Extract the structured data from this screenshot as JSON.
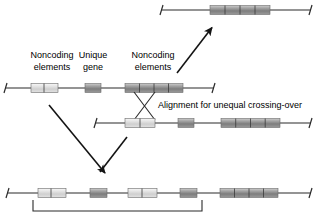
{
  "figure": {
    "background_color": "#ffffff",
    "width": 318,
    "height": 217
  },
  "labels": {
    "noncoding_left_line1": "Noncoding",
    "noncoding_left_line2": "elements",
    "unique_gene_line1": "Unique",
    "unique_gene_line2": "gene",
    "noncoding_right_line1": "Noncoding",
    "noncoding_right_line2": "elements",
    "alignment_text": "Alignment for unequal crossing-over"
  },
  "colors": {
    "line": "#2b2b2b",
    "light_block_fill": "#d9d9d9",
    "light_block_edge": "#f2f2f2",
    "dark_block_fill": "#8c8c8c",
    "dark_block_edge": "#bdbdbd",
    "block_outline": "#6a6a6a",
    "divider": "#3a3a3a",
    "arrow": "#141414",
    "text": "#000000"
  },
  "chromosomes": [
    {
      "id": "product-chromosome-top",
      "name": "Top recombinant chromosome",
      "y": 10,
      "x_start": 160,
      "x_end": 312,
      "blocks": [
        {
          "type": "noncoding",
          "shade": "dark",
          "x": 210,
          "width": 60,
          "segments": 4
        }
      ]
    },
    {
      "id": "parent-chromosome-upper",
      "name": "Upper parental chromosome",
      "y": 88,
      "x_start": 4,
      "x_end": 215,
      "blocks": [
        {
          "type": "noncoding",
          "shade": "light",
          "x": 31,
          "width": 27,
          "segments": 2
        },
        {
          "type": "unique-gene",
          "shade": "dark",
          "x": 85,
          "width": 16,
          "segments": 1
        },
        {
          "type": "noncoding",
          "shade": "dark",
          "x": 125,
          "width": 58,
          "segments": 4
        }
      ]
    },
    {
      "id": "parent-chromosome-lower",
      "name": "Lower parental chromosome",
      "y": 123,
      "x_start": 94,
      "x_end": 312,
      "blocks": [
        {
          "type": "noncoding",
          "shade": "light",
          "x": 125,
          "width": 30,
          "segments": 2
        },
        {
          "type": "unique-gene",
          "shade": "dark",
          "x": 178,
          "width": 16,
          "segments": 1
        },
        {
          "type": "noncoding",
          "shade": "dark",
          "x": 221,
          "width": 59,
          "segments": 4
        }
      ]
    },
    {
      "id": "product-chromosome-bottom",
      "name": "Bottom recombinant chromosome",
      "y": 193,
      "x_start": 6,
      "x_end": 312,
      "blocks": [
        {
          "type": "noncoding",
          "shade": "light",
          "x": 38,
          "width": 28,
          "segments": 2
        },
        {
          "type": "unique-gene",
          "shade": "dark",
          "x": 90,
          "width": 17,
          "segments": 1
        },
        {
          "type": "noncoding",
          "shade": "light",
          "x": 128,
          "width": 29,
          "segments": 2
        },
        {
          "type": "unique-gene",
          "shade": "dark",
          "x": 180,
          "width": 17,
          "segments": 1
        },
        {
          "type": "noncoding",
          "shade": "dark",
          "x": 220,
          "width": 58,
          "segments": 4
        }
      ]
    }
  ],
  "crossover": {
    "name": "unequal-crossing-over-x",
    "strand_a": {
      "x1": 134,
      "y1": 92,
      "x2": 155,
      "y2": 120
    },
    "strand_b": {
      "x1": 155,
      "y1": 92,
      "x2": 134,
      "y2": 120
    }
  },
  "arrows": [
    {
      "id": "arrow-to-top-product",
      "x1": 177,
      "y1": 73,
      "x2": 214,
      "y2": 26
    },
    {
      "id": "arrow-upper-to-bottom-product",
      "x1": 49,
      "y1": 105,
      "x2": 107,
      "y2": 176
    },
    {
      "id": "arrow-lower-to-bottom-product",
      "x1": 127,
      "y1": 137,
      "x2": 98,
      "y2": 174
    }
  ],
  "bracket": {
    "name": "duplication-bracket",
    "x_left": 33,
    "x_right": 202,
    "y_top": 200,
    "y_bottom": 211
  }
}
